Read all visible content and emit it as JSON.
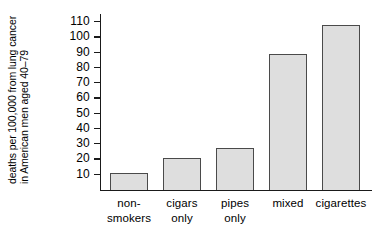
{
  "chart_data": {
    "type": "bar",
    "title": "",
    "subtitle": "",
    "xlabel": "",
    "ylabel": "deaths per 100,000 from lung cancer in American men aged 40–79",
    "ylabel_lines": [
      "deaths per 100,000 from lung cancer",
      "in American men aged 40–79"
    ],
    "categories": [
      "non-smokers",
      "cigars only",
      "pipes only",
      "mixed",
      "cigarettes"
    ],
    "category_lines": [
      [
        "non-",
        "smokers"
      ],
      [
        "cigars",
        "only"
      ],
      [
        "pipes",
        "only"
      ],
      [
        "mixed"
      ],
      [
        "cigarettes"
      ]
    ],
    "values": [
      11,
      21,
      27,
      89,
      108
    ],
    "ylim": [
      0,
      115
    ],
    "yticks": [
      10,
      20,
      30,
      40,
      50,
      60,
      70,
      80,
      90,
      100,
      110
    ],
    "ytick_labels": [
      "10",
      "20",
      "30",
      "40",
      "50",
      "60",
      "70",
      "80",
      "90",
      "100",
      "110"
    ],
    "grid": false,
    "legend": null,
    "bar_fill_color": "#dedede",
    "bar_edge_color": "#4a4a4a",
    "axis_color": "#1a1a1a",
    "background_color": "#ffffff"
  }
}
